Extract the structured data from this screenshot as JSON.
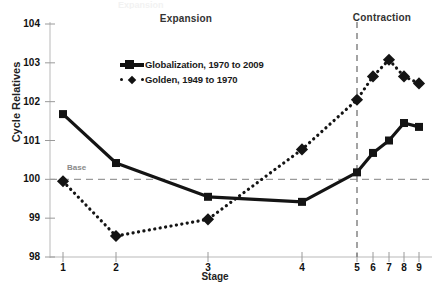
{
  "title_ghost": "Expansion",
  "annotations": {
    "expansion": "Expansion",
    "contraction": "Contraction",
    "base": "Base"
  },
  "legend": {
    "items": [
      {
        "label": "Globalization, 1970 to 2009",
        "marker": "square-solid-line",
        "color": "#141414"
      },
      {
        "label": "Golden, 1949 to 1970",
        "marker": "diamond-dotted-line",
        "color": "#141414"
      }
    ]
  },
  "chart_data": {
    "type": "line",
    "title": "",
    "xlabel": "Stage",
    "ylabel": "Cycle Relatives",
    "ylim": [
      98,
      104
    ],
    "yticks": [
      98,
      99,
      100,
      101,
      102,
      103,
      104
    ],
    "categories": [
      "1",
      "2",
      "3",
      "4",
      "5",
      "6",
      "7",
      "8",
      "9"
    ],
    "x": [
      1,
      2,
      3,
      4,
      5,
      6,
      7,
      8,
      9
    ],
    "grid": false,
    "legend_position": "upper-center-left",
    "series": [
      {
        "name": "Globalization, 1970 to 2009",
        "style": "solid",
        "marker": "square",
        "color": "#141414",
        "values": [
          101.68,
          100.42,
          99.55,
          99.42,
          100.18,
          100.68,
          101.0,
          101.45,
          101.35
        ]
      },
      {
        "name": "Golden, 1949 to 1970",
        "style": "dotted",
        "marker": "diamond",
        "color": "#141414",
        "values": [
          99.95,
          98.54,
          98.97,
          100.77,
          102.05,
          102.65,
          103.08,
          102.65,
          102.47
        ]
      }
    ],
    "reference_lines": [
      {
        "name": "base",
        "orientation": "horizontal",
        "value": 100,
        "label": "Base",
        "style": "dashed"
      },
      {
        "name": "phase-divider",
        "orientation": "vertical",
        "value": 5,
        "style": "dashed"
      }
    ],
    "regions": [
      {
        "label": "Expansion",
        "from": 1,
        "to": 5
      },
      {
        "label": "Contraction",
        "from": 5,
        "to": 9
      }
    ]
  }
}
